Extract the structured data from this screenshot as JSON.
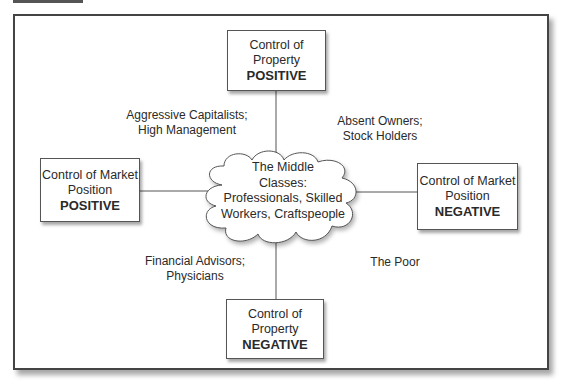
{
  "diagram": {
    "top_box": {
      "line1": "Control of",
      "line2": "Property",
      "emphasis": "POSITIVE"
    },
    "left_box": {
      "line1": "Control of Market",
      "line2": "Position",
      "emphasis": "POSITIVE"
    },
    "right_box": {
      "line1": "Control of Market",
      "line2": "Position",
      "emphasis": "NEGATIVE"
    },
    "bottom_box": {
      "line1": "Control of",
      "line2": "Property",
      "emphasis": "NEGATIVE"
    },
    "center_cloud": {
      "line1": "The Middle",
      "line2": "Classes:",
      "line3": "Professionals, Skilled",
      "line4": "Workers, Craftspeople"
    },
    "quadrants": {
      "top_left": {
        "line1": "Aggressive Capitalists;",
        "line2": "High Management"
      },
      "top_right": {
        "line1": "Absent Owners;",
        "line2": "Stock Holders"
      },
      "bottom_left": {
        "line1": "Financial Advisors;",
        "line2": "Physicians"
      },
      "bottom_right": {
        "line1": "The Poor"
      }
    },
    "colors": {
      "line": "#555555",
      "frame": "#444444",
      "text": "#2a2a2a"
    }
  }
}
